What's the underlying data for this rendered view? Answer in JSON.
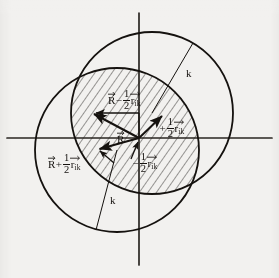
{
  "figure": {
    "type": "vector-geometry-diagram",
    "background_color": "#f2f1ef",
    "ink_color": "#15120f"
  },
  "axes": {
    "origin": {
      "x": 139,
      "y": 138
    },
    "horizontal": {
      "name": "x-axis",
      "x1": 7,
      "y1": 138,
      "x2": 272,
      "y2": 138
    },
    "vertical": {
      "name": "y-axis",
      "x1": 139,
      "y1": 13,
      "x2": 139,
      "y2": 265
    }
  },
  "circles": [
    {
      "name": "upper-right-circle",
      "cx": 152,
      "cy": 113,
      "r": 81,
      "radius_label": "k",
      "radius_line": {
        "x1": 152,
        "y1": 113,
        "x2": 193,
        "y2": 43
      }
    },
    {
      "name": "lower-left-circle",
      "cx": 117,
      "cy": 150,
      "r": 82,
      "radius_label": "k",
      "radius_line": {
        "x1": 117,
        "y1": 150,
        "x2": 96,
        "y2": 230
      }
    }
  ],
  "hatched_region": {
    "name": "circle-intersection-lens",
    "pattern": "diagonal-hatching",
    "angle_deg": 35
  },
  "vectors": [
    {
      "name": "vector-R-minus-half-r",
      "from": {
        "x": 139,
        "y": 138
      },
      "to": {
        "x": 92,
        "y": 113
      },
      "label_id": "lbl-top"
    },
    {
      "name": "vector-R",
      "from": {
        "x": 139,
        "y": 138
      },
      "to": {
        "x": 97,
        "y": 150
      },
      "label_id": "lbl-Rvec"
    },
    {
      "name": "vector-plus-half-r",
      "from": {
        "x": 139,
        "y": 138
      },
      "to": {
        "x": 164,
        "y": 114
      },
      "label_id": "lbl-right"
    },
    {
      "name": "vector-minus-half-r",
      "from": {
        "x": 139,
        "y": 113
      },
      "to": {
        "x": 92,
        "y": 113
      },
      "label_id": "lbl-center"
    },
    {
      "name": "leader-R-plus-half-r",
      "from": {
        "x": 112,
        "y": 160
      },
      "to": {
        "x": 97,
        "y": 150
      }
    },
    {
      "name": "leader-minus-half-r",
      "from": {
        "x": 130,
        "y": 158
      },
      "to": {
        "x": 139,
        "y": 140
      }
    }
  ],
  "labels": {
    "top": {
      "id": "lbl-top",
      "plain": "R⃗ - 1/2 r⃗_ik",
      "vector_symbol": "R",
      "operator": "−",
      "fraction_numerator": "1",
      "fraction_denominator": "2",
      "vector_symbol_2": "r",
      "subscript": "ik"
    },
    "right": {
      "id": "lbl-right",
      "plain": "+1/2 r⃗_ik",
      "operator": "+",
      "fraction_numerator": "1",
      "fraction_denominator": "2",
      "vector_symbol": "r",
      "subscript": "ik"
    },
    "left": {
      "id": "lbl-left",
      "plain": "R⃗ + 1/2 r⃗_ik",
      "vector_symbol": "R",
      "operator": "+",
      "fraction_numerator": "1",
      "fraction_denominator": "2",
      "vector_symbol_2": "r",
      "subscript": "ik"
    },
    "center": {
      "id": "lbl-center",
      "plain": "-1/2 r⃗_ik",
      "operator": "−",
      "fraction_numerator": "1",
      "fraction_denominator": "2",
      "vector_symbol": "r",
      "subscript": "ik"
    },
    "origin_vector": {
      "id": "lbl-Rvec",
      "plain": "R⃗",
      "vector_symbol": "R"
    },
    "k_upper": {
      "id": "lbl-k-top",
      "text": "k"
    },
    "k_lower": {
      "id": "lbl-k-bot",
      "text": "k"
    }
  }
}
